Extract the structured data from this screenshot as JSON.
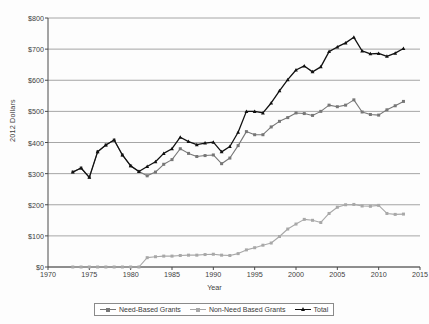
{
  "chart_data": {
    "type": "line",
    "title": "",
    "xlabel": "Year",
    "ylabel": "2012 Dollars",
    "xlim": [
      1970,
      2015
    ],
    "ylim": [
      0,
      800
    ],
    "xticks": [
      1970,
      1975,
      1980,
      1985,
      1990,
      1995,
      2000,
      2005,
      2010,
      2015
    ],
    "yticks": [
      0,
      100,
      200,
      300,
      400,
      500,
      600,
      700,
      800
    ],
    "ytick_labels": [
      "$0",
      "$100",
      "$200",
      "$300",
      "$400",
      "$500",
      "$600",
      "$700",
      "$800"
    ],
    "xtick_labels": [
      "1970",
      "1975",
      "1980",
      "1985",
      "1990",
      "1995",
      "2000",
      "2005",
      "2010",
      "2015"
    ],
    "grid": "horizontal",
    "legend_position": "bottom",
    "x": [
      1973,
      1974,
      1975,
      1976,
      1977,
      1978,
      1979,
      1980,
      1981,
      1982,
      1983,
      1984,
      1985,
      1986,
      1987,
      1988,
      1989,
      1990,
      1991,
      1992,
      1993,
      1994,
      1995,
      1996,
      1997,
      1998,
      1999,
      2000,
      2001,
      2002,
      2003,
      2004,
      2005,
      2006,
      2007,
      2008,
      2009,
      2010,
      2011,
      2012,
      2013
    ],
    "series": [
      {
        "name": "Need-Based Grants",
        "color": "#777777",
        "marker": "square",
        "values": [
          305,
          318,
          288,
          370,
          392,
          408,
          360,
          325,
          307,
          293,
          305,
          330,
          345,
          380,
          365,
          355,
          358,
          360,
          332,
          350,
          390,
          435,
          425,
          425,
          450,
          468,
          480,
          495,
          493,
          487,
          500,
          520,
          515,
          520,
          537,
          498,
          490,
          488,
          505,
          518,
          532
        ]
      },
      {
        "name": "Non-Need Based Grants",
        "color": "#a8a8a8",
        "marker": "square",
        "values": [
          0,
          0,
          0,
          0,
          0,
          0,
          0,
          0,
          0,
          30,
          33,
          35,
          35,
          37,
          38,
          38,
          40,
          41,
          38,
          37,
          43,
          55,
          62,
          70,
          77,
          98,
          122,
          138,
          153,
          150,
          143,
          172,
          192,
          200,
          201,
          196,
          195,
          198,
          172,
          169,
          170
        ]
      },
      {
        "name": "Total",
        "color": "#111111",
        "marker": "triangle",
        "values": [
          305,
          318,
          288,
          370,
          392,
          408,
          360,
          325,
          307,
          323,
          338,
          365,
          380,
          417,
          403,
          393,
          398,
          401,
          370,
          387,
          433,
          500,
          500,
          495,
          527,
          566,
          602,
          633,
          646,
          627,
          643,
          692,
          707,
          720,
          738,
          694,
          685,
          686,
          677,
          687,
          702
        ]
      }
    ]
  },
  "legend": {
    "items": [
      {
        "label": "Need-Based Grants"
      },
      {
        "label": "Non-Need Based Grants"
      },
      {
        "label": "Total"
      }
    ]
  },
  "axes": {
    "x_title": "Year",
    "y_title": "2012 Dollars"
  }
}
